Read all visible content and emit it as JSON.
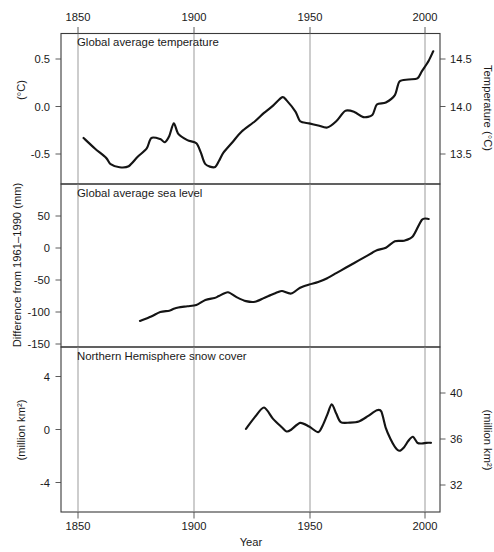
{
  "figure": {
    "background_color": "#ffffff",
    "line_color": "#141414",
    "grid_color": "#8a8a8a",
    "frame_color": "#3a3a3a",
    "xlabel": "Year",
    "x_ticks_top": [
      "1850",
      "1900",
      "1950",
      "2000"
    ],
    "x_ticks_bottom": [
      "1850",
      "1900",
      "1950",
      "2000"
    ]
  },
  "chart_data": [
    {
      "type": "line",
      "title": "Global average temperature",
      "xlabel": "Year",
      "ylabel": "(°C)",
      "ylabel_right": "Temperature (°C)",
      "xlim": [
        1840,
        2008
      ],
      "ylim": [
        -0.72,
        0.72
      ],
      "ylim_right": [
        13.28,
        14.72
      ],
      "yticks": [
        "0.5",
        "0.0",
        "-0.5"
      ],
      "ytick_values": [
        0.5,
        0.0,
        -0.5
      ],
      "yticks_right": [
        "14.5",
        "14.0",
        "13.5"
      ],
      "ytick_values_right": [
        14.5,
        14.0,
        13.5
      ],
      "grid": "vertical-only",
      "legend": "none",
      "x": [
        1850,
        1855,
        1860,
        1862,
        1866,
        1870,
        1874,
        1878,
        1880,
        1884,
        1886,
        1888,
        1890,
        1892,
        1896,
        1900,
        1902,
        1904,
        1908,
        1910,
        1912,
        1916,
        1920,
        1926,
        1930,
        1934,
        1938,
        1940,
        1944,
        1946,
        1950,
        1954,
        1958,
        1962,
        1966,
        1970,
        1974,
        1978,
        1980,
        1984,
        1988,
        1990,
        1994,
        1998,
        2000,
        2003,
        2005
      ],
      "values": [
        -0.28,
        -0.38,
        -0.47,
        -0.53,
        -0.56,
        -0.55,
        -0.46,
        -0.38,
        -0.28,
        -0.29,
        -0.32,
        -0.26,
        -0.14,
        -0.24,
        -0.3,
        -0.33,
        -0.42,
        -0.53,
        -0.56,
        -0.5,
        -0.42,
        -0.32,
        -0.22,
        -0.12,
        -0.04,
        0.03,
        0.11,
        0.08,
        -0.03,
        -0.12,
        -0.14,
        -0.16,
        -0.18,
        -0.12,
        -0.02,
        -0.03,
        -0.08,
        -0.06,
        0.04,
        0.06,
        0.13,
        0.26,
        0.28,
        0.29,
        0.36,
        0.46,
        0.55
      ]
    },
    {
      "type": "line",
      "title": "Global average sea level",
      "xlabel": "Year",
      "ylabel": "Difference from 1961–1990 (mm)",
      "xlim": [
        1840,
        2008
      ],
      "ylim": [
        -178,
        78
      ],
      "yticks": [
        "50",
        "0",
        "-50",
        "-100",
        "-150"
      ],
      "ytick_values": [
        50,
        0,
        -50,
        -100,
        -150
      ],
      "grid": "vertical-only",
      "legend": "none",
      "x": [
        1875,
        1880,
        1884,
        1888,
        1890,
        1892,
        1896,
        1900,
        1904,
        1908,
        1910,
        1914,
        1918,
        1922,
        1926,
        1930,
        1932,
        1936,
        1938,
        1942,
        1946,
        1950,
        1954,
        1958,
        1962,
        1966,
        1970,
        1974,
        1978,
        1980,
        1984,
        1988,
        1992,
        1996,
        2000,
        2003
      ],
      "values": [
        -137,
        -130,
        -123,
        -121,
        -118,
        -116,
        -114,
        -112,
        -104,
        -101,
        -98,
        -92,
        -100,
        -106,
        -107,
        -101,
        -98,
        -92,
        -90,
        -94,
        -85,
        -80,
        -76,
        -70,
        -62,
        -54,
        -46,
        -38,
        -30,
        -26,
        -22,
        -12,
        -11,
        -4,
        22,
        23
      ]
    },
    {
      "type": "line",
      "title": "Northern Hemisphere snow cover",
      "xlabel": "Year",
      "ylabel": "(million km²)",
      "ylabel_right": "(million km²)",
      "xlim": [
        1840,
        2008
      ],
      "ylim": [
        -6.2,
        6.2
      ],
      "ylim_right": [
        30.0,
        42.4
      ],
      "yticks": [
        "4",
        "0",
        "-4"
      ],
      "ytick_values": [
        4,
        0,
        -4
      ],
      "yticks_right": [
        "40",
        "36",
        "32"
      ],
      "ytick_values_right": [
        40,
        36,
        32
      ],
      "grid": "vertical-only",
      "legend": "none",
      "x": [
        1922,
        1926,
        1930,
        1934,
        1938,
        1940,
        1942,
        1946,
        1950,
        1954,
        1956,
        1958,
        1960,
        1962,
        1964,
        1968,
        1972,
        1976,
        1980,
        1982,
        1984,
        1986,
        1988,
        1990,
        1992,
        1994,
        1996,
        1998,
        2000,
        2002,
        2004
      ],
      "values": [
        0.05,
        0.95,
        1.65,
        0.8,
        0.15,
        -0.15,
        -0.02,
        0.5,
        0.22,
        -0.2,
        0.3,
        1.1,
        1.9,
        1.2,
        0.55,
        0.52,
        0.6,
        1.0,
        1.45,
        1.35,
        0.1,
        -0.7,
        -1.3,
        -1.6,
        -1.35,
        -0.85,
        -0.55,
        -1.0,
        -1.05,
        -1.0,
        -1.0
      ]
    }
  ]
}
